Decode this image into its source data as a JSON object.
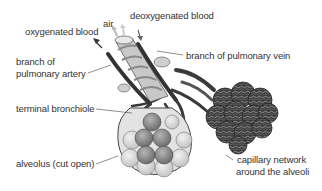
{
  "diagram": {
    "labels": {
      "air": "air",
      "deoxygenated_blood": "deoxygenated blood",
      "oxygenated_blood": "oxygenated blood",
      "branch_pulmonary_artery_line1": "branch of",
      "branch_pulmonary_artery_line2": "pulmonary artery",
      "branch_pulmonary_vein": "branch of pulmonary vein",
      "terminal_bronchiole": "terminal bronchiole",
      "alveolus_cut_open": "alveolus (cut open)",
      "capillary_network_line1": "capillary network",
      "capillary_network_line2": "around the alveoli"
    },
    "colors": {
      "text": "#333333",
      "vessel_dark": "#3a3a3a",
      "bronchiole": "#bdbdbd",
      "alveolus_light": "#d9d9d9",
      "alveolus_dark": "#8a8a8a",
      "capillary": "#4a4a4a",
      "background": "#ffffff"
    }
  }
}
